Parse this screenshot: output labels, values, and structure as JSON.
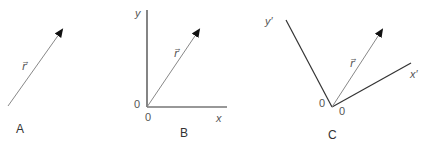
{
  "panels": [
    {
      "id": "A",
      "caption": "A",
      "vector_label": "r⃗"
    },
    {
      "id": "B",
      "caption": "B",
      "vector_label": "r⃗",
      "y_axis_label": "y",
      "x_axis_label": "x",
      "origin_label_left": "0",
      "origin_label_below": "0"
    },
    {
      "id": "C",
      "caption": "C",
      "vector_label": "r⃗",
      "y_axis_label": "y′",
      "x_axis_label": "x′",
      "origin_label_left": "0",
      "origin_label_right": "0"
    }
  ],
  "colors": {
    "line": "#777777",
    "axis": "#333333",
    "arrowhead": "#111111"
  }
}
